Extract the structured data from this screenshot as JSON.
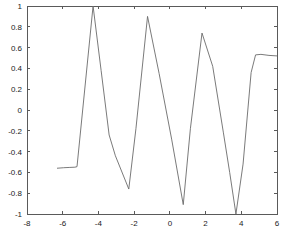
{
  "chart_data": {
    "type": "line",
    "title": "",
    "xlabel": "",
    "ylabel": "",
    "xlim": [
      -8,
      6
    ],
    "ylim": [
      -1,
      1
    ],
    "grid": false,
    "legend": null,
    "x_ticks": [
      -8,
      -6,
      -4,
      -2,
      0,
      2,
      4,
      6
    ],
    "x_tick_labels": [
      "-8",
      "-6",
      "-4",
      "-2",
      "0",
      "2",
      "4",
      "6"
    ],
    "y_ticks": [
      -1,
      -0.8,
      -0.6,
      -0.4,
      -0.2,
      0,
      0.2,
      0.4,
      0.6,
      0.8,
      1
    ],
    "y_tick_labels": [
      "-1",
      "-0.8",
      "-0.6",
      "-0.4",
      "-0.2",
      "0",
      "0.2",
      "0.4",
      "0.6",
      "0.8",
      "1"
    ],
    "series": [
      {
        "name": "signal",
        "color": "#6b6b6b",
        "x": [
          -6.32,
          -5.95,
          -5.6,
          -5.32,
          -5.2,
          -4.3,
          -3.85,
          -3.4,
          -3.05,
          -2.3,
          -1.9,
          -1.25,
          -0.6,
          0.1,
          0.75,
          1.15,
          1.8,
          2.4,
          3.0,
          3.35,
          3.7,
          4.1,
          4.55,
          4.8,
          5.1,
          5.55,
          6.0
        ],
        "y": [
          -0.56,
          -0.555,
          -0.552,
          -0.55,
          -0.545,
          1.0,
          0.38,
          -0.24,
          -0.44,
          -0.76,
          -0.18,
          0.9,
          0.35,
          -0.28,
          -0.91,
          -0.18,
          0.74,
          0.42,
          -0.22,
          -0.6,
          -1.0,
          -0.52,
          0.36,
          0.53,
          0.535,
          0.525,
          0.52
        ]
      }
    ]
  },
  "figure": {
    "background_color": "#ffffff",
    "axes_color": "#5a5a5a",
    "line_color": "#6b6b6b"
  }
}
